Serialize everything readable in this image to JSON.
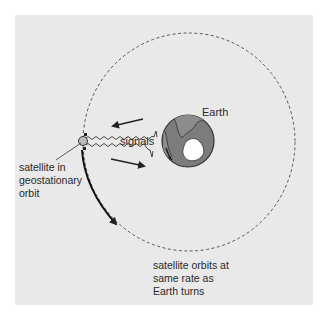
{
  "diagram": {
    "labels": {
      "earth": "Earth",
      "signals": "signals",
      "satellite": "satellite in\ngeostationary\norbit",
      "orbit_note": "satellite orbits at\nsame rate as\nEarth turns"
    },
    "colors": {
      "background": "#e9e9e9",
      "earth_ocean": "#7a7a7a",
      "earth_land": "#8a8a8a",
      "antarctica": "#ffffff",
      "lines": "#222222",
      "orbit_dashes": "#555555"
    },
    "elements": {
      "orbit": "dashed circular orbit",
      "earth": "globe",
      "satellite": "satellite",
      "signals": "wavy signal lines (uplink & downlink)",
      "rotation_arrow": "curved arrow along orbit"
    }
  }
}
